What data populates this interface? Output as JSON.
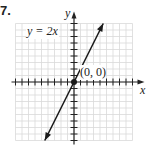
{
  "problem_number": "7.",
  "chart_data": {
    "type": "line",
    "title": "",
    "equation_label": "y = 2x",
    "xlabel": "x",
    "ylabel": "y",
    "xlim": [
      -9,
      9
    ],
    "ylim": [
      -9,
      9
    ],
    "grid": true,
    "series": [
      {
        "name": "y = 2x",
        "x": [
          -4.5,
          0,
          4.5
        ],
        "y": [
          -9,
          0,
          9
        ],
        "arrows": "both"
      }
    ],
    "points": [
      {
        "x": 0,
        "y": 0,
        "label": "(0, 0)"
      }
    ],
    "colors": {
      "line": "#1a1a1a",
      "grid": "#d9d9d9",
      "axis": "#222222"
    }
  }
}
